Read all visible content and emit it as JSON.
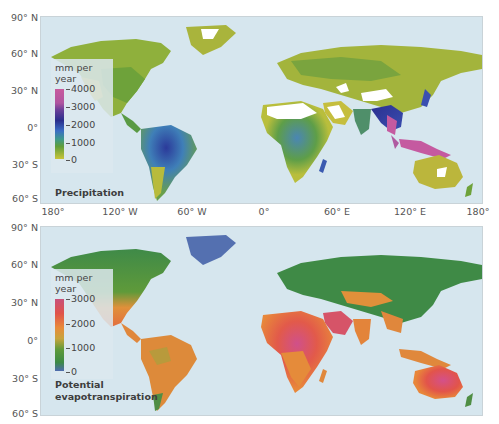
{
  "figure": {
    "lat_labels_top": [
      "90° N",
      "60° N",
      "30° N",
      "0°",
      "30° S",
      "60° S"
    ],
    "lat_labels_bottom": [
      "90° N",
      "60° N",
      "30° N",
      "0°",
      "30° S",
      "60° S"
    ],
    "lon_labels": [
      "180°",
      "120° W",
      "60° W",
      "0°",
      "60° E",
      "120° E",
      "180°"
    ],
    "ocean_color": "#d6e6ee"
  },
  "panels": [
    {
      "title": "Precipitation",
      "legend": {
        "unit_line1": "mm per",
        "unit_line2": "year",
        "ticks": [
          "4000",
          "3000",
          "2000",
          "1000",
          "0"
        ],
        "colors": [
          "#c85a9e",
          "#b0559f",
          "#2a2e8c",
          "#3b6ec4",
          "#3e9a8a",
          "#5f9e3a",
          "#c9c43a"
        ]
      }
    },
    {
      "title_line1": "Potential",
      "title_line2": "evapotranspiration",
      "legend": {
        "unit_line1": "mm per",
        "unit_line2": "year",
        "ticks": [
          "3000",
          "2000",
          "1000",
          "0"
        ],
        "colors": [
          "#c8507a",
          "#e0534a",
          "#e88b3a",
          "#c7a43c",
          "#5f9a3a",
          "#3d8a45",
          "#4e6bb0"
        ]
      }
    }
  ]
}
